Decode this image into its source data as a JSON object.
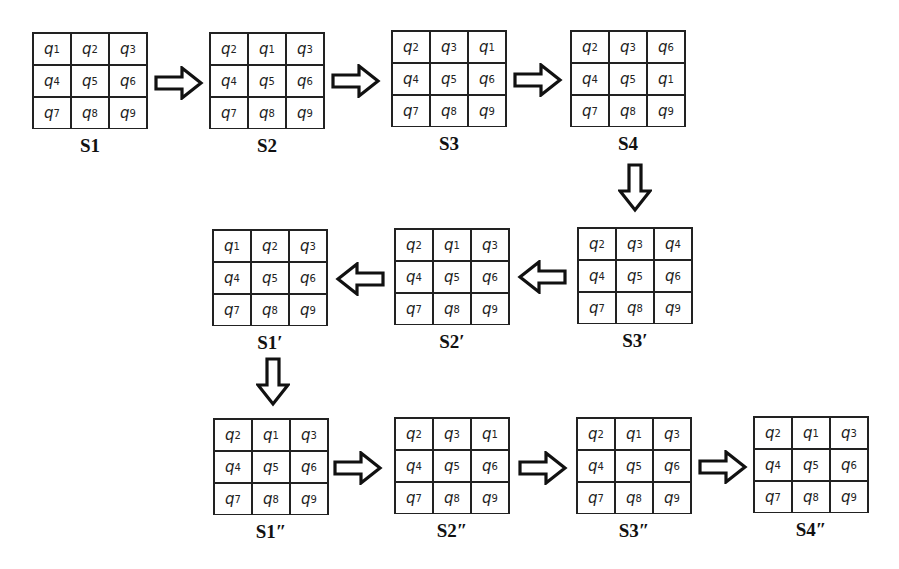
{
  "diagram": {
    "type": "state-transition-sequence",
    "rows": [
      {
        "direction": "right",
        "states": [
          {
            "label": "S1",
            "cells": [
              "q1",
              "q2",
              "q3",
              "q4",
              "q5",
              "q6",
              "q7",
              "q8",
              "q9"
            ]
          },
          {
            "label": "S2",
            "cells": [
              "q2",
              "q1",
              "q3",
              "q4",
              "q5",
              "q6",
              "q7",
              "q8",
              "q9"
            ]
          },
          {
            "label": "S3",
            "cells": [
              "q2",
              "q3",
              "q1",
              "q4",
              "q5",
              "q6",
              "q7",
              "q8",
              "q9"
            ]
          },
          {
            "label": "S4",
            "cells": [
              "q2",
              "q3",
              "q6",
              "q4",
              "q5",
              "q1",
              "q7",
              "q8",
              "q9"
            ]
          }
        ]
      },
      {
        "direction": "left",
        "states": [
          {
            "label": "S3′",
            "cells": [
              "q2",
              "q3",
              "q4",
              "q4",
              "q5",
              "q6",
              "q7",
              "q8",
              "q9"
            ]
          },
          {
            "label": "S2′",
            "cells": [
              "q2",
              "q1",
              "q3",
              "q4",
              "q5",
              "q6",
              "q7",
              "q8",
              "q9"
            ]
          },
          {
            "label": "S1′",
            "cells": [
              "q1",
              "q2",
              "q3",
              "q4",
              "q5",
              "q6",
              "q7",
              "q8",
              "q9"
            ]
          }
        ]
      },
      {
        "direction": "right",
        "states": [
          {
            "label": "S1″",
            "cells": [
              "q2",
              "q1",
              "q3",
              "q4",
              "q5",
              "q6",
              "q7",
              "q8",
              "q9"
            ]
          },
          {
            "label": "S2″",
            "cells": [
              "q2",
              "q3",
              "q1",
              "q4",
              "q5",
              "q6",
              "q7",
              "q8",
              "q9"
            ]
          },
          {
            "label": "S3″",
            "cells": [
              "q2",
              "q1",
              "q3",
              "q4",
              "q5",
              "q6",
              "q7",
              "q8",
              "q9"
            ]
          },
          {
            "label": "S4″",
            "cells": [
              "q2",
              "q1",
              "q3",
              "q4",
              "q5",
              "q6",
              "q7",
              "q8",
              "q9"
            ]
          }
        ]
      }
    ],
    "arrows": [
      {
        "from": "S1",
        "to": "S2",
        "direction": "right"
      },
      {
        "from": "S2",
        "to": "S3",
        "direction": "right"
      },
      {
        "from": "S3",
        "to": "S4",
        "direction": "right"
      },
      {
        "from": "S4",
        "to": "S3′",
        "direction": "down"
      },
      {
        "from": "S3′",
        "to": "S2′",
        "direction": "left"
      },
      {
        "from": "S2′",
        "to": "S1′",
        "direction": "left"
      },
      {
        "from": "S1′",
        "to": "S1″",
        "direction": "down"
      },
      {
        "from": "S1″",
        "to": "S2″",
        "direction": "right"
      },
      {
        "from": "S2″",
        "to": "S3″",
        "direction": "right"
      },
      {
        "from": "S3″",
        "to": "S4″",
        "direction": "right"
      }
    ]
  },
  "states": {
    "s1": {
      "label": "S1",
      "x": 32,
      "y": 32,
      "cells": [
        "q1",
        "q2",
        "q3",
        "q4",
        "q5",
        "q6",
        "q7",
        "q8",
        "q9"
      ]
    },
    "s2": {
      "label": "S2",
      "x": 209,
      "y": 32,
      "cells": [
        "q2",
        "q1",
        "q3",
        "q4",
        "q5",
        "q6",
        "q7",
        "q8",
        "q9"
      ]
    },
    "s3": {
      "label": "S3",
      "x": 391,
      "y": 30,
      "cells": [
        "q2",
        "q3",
        "q1",
        "q4",
        "q5",
        "q6",
        "q7",
        "q8",
        "q9"
      ]
    },
    "s4": {
      "label": "S4",
      "x": 570,
      "y": 30,
      "cells": [
        "q2",
        "q3",
        "q6",
        "q4",
        "q5",
        "q1",
        "q7",
        "q8",
        "q9"
      ]
    },
    "s1p": {
      "label": "S1′",
      "x": 212,
      "y": 229,
      "cells": [
        "q1",
        "q2",
        "q3",
        "q4",
        "q5",
        "q6",
        "q7",
        "q8",
        "q9"
      ]
    },
    "s2p": {
      "label": "S2′",
      "x": 394,
      "y": 228,
      "cells": [
        "q2",
        "q1",
        "q3",
        "q4",
        "q5",
        "q6",
        "q7",
        "q8",
        "q9"
      ]
    },
    "s3p": {
      "label": "S3′",
      "x": 577,
      "y": 227,
      "cells": [
        "q2",
        "q3",
        "q4",
        "q4",
        "q5",
        "q6",
        "q7",
        "q8",
        "q9"
      ]
    },
    "s1pp": {
      "label": "S1″",
      "x": 213,
      "y": 418,
      "cells": [
        "q2",
        "q1",
        "q3",
        "q4",
        "q5",
        "q6",
        "q7",
        "q8",
        "q9"
      ]
    },
    "s2pp": {
      "label": "S2″",
      "x": 394,
      "y": 417,
      "cells": [
        "q2",
        "q3",
        "q1",
        "q4",
        "q5",
        "q6",
        "q7",
        "q8",
        "q9"
      ]
    },
    "s3pp": {
      "label": "S3″",
      "x": 576,
      "y": 417,
      "cells": [
        "q2",
        "q1",
        "q3",
        "q4",
        "q5",
        "q6",
        "q7",
        "q8",
        "q9"
      ]
    },
    "s4pp": {
      "label": "S4″",
      "x": 753,
      "y": 416,
      "cells": [
        "q2",
        "q1",
        "q3",
        "q4",
        "q5",
        "q6",
        "q7",
        "q8",
        "q9"
      ]
    }
  },
  "arrow_positions": [
    {
      "id": "a1",
      "dir": "right",
      "x": 154,
      "y": 66
    },
    {
      "id": "a2",
      "dir": "right",
      "x": 331,
      "y": 64
    },
    {
      "id": "a3",
      "dir": "right",
      "x": 513,
      "y": 63
    },
    {
      "id": "a4",
      "dir": "down",
      "x": 618,
      "y": 163
    },
    {
      "id": "a5",
      "dir": "left",
      "x": 517,
      "y": 260
    },
    {
      "id": "a6",
      "dir": "left",
      "x": 335,
      "y": 262
    },
    {
      "id": "a7",
      "dir": "down",
      "x": 256,
      "y": 357
    },
    {
      "id": "a8",
      "dir": "right",
      "x": 333,
      "y": 451
    },
    {
      "id": "a9",
      "dir": "right",
      "x": 518,
      "y": 451
    },
    {
      "id": "a10",
      "dir": "right",
      "x": 698,
      "y": 450
    }
  ]
}
